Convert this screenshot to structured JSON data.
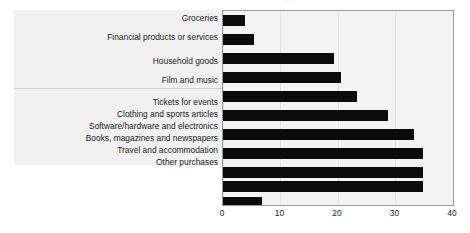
{
  "figure": {
    "title_remnant": "''",
    "background_color": "#fefefe",
    "label_panel_color": "#f1f1f1",
    "plot_background_color": "#f3f3f3",
    "bar_color": "#0b0b0b",
    "frame_color": "#9a9a9a",
    "gridline_color": "#e2e2e2"
  },
  "chart_data": {
    "type": "bar",
    "orientation": "horizontal",
    "title": "",
    "xlabel": "",
    "ylabel": "",
    "xlim": [
      0,
      40
    ],
    "xticks": [
      "0",
      "10",
      "20",
      "30",
      "40"
    ],
    "grid": true,
    "legend": "none",
    "categories": [
      "Groceries",
      "Financial products or services",
      "Household goods",
      "Film and music",
      "Tickets for events",
      "Clothing and sports articles",
      "Software/hardware and electronics",
      "Books, magazines and newspapers",
      "Travel and accommodation",
      "Other purchases"
    ],
    "values": [
      3.8,
      5.4,
      19.3,
      20.5,
      23.3,
      28.7,
      33.2,
      34.8,
      34.8,
      6.8
    ],
    "bar_count": 11
  },
  "bars": [
    {
      "value": 3.8
    },
    {
      "value": 5.4
    },
    {
      "value": 19.3
    },
    {
      "value": 20.5
    },
    {
      "value": 23.3
    },
    {
      "value": 28.7
    },
    {
      "value": 33.2
    },
    {
      "value": 34.8
    },
    {
      "value": 34.8
    },
    {
      "value": 34.8
    },
    {
      "value": 6.8
    }
  ]
}
